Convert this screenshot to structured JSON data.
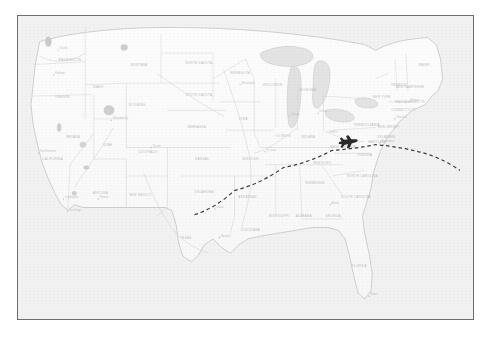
{
  "document": {
    "title": "United States Flight Path Map",
    "type": "map",
    "frame_style": "thin dark rectangular border"
  },
  "colors": {
    "page_background": "#ffffff",
    "frame_border": "#6e6e6e",
    "map_background": "#f2f2f2",
    "land_fill": "#fbfbfb",
    "water_fill": "#e2e2e2",
    "state_border": "#d5d5d5",
    "coastline": "#b8b8b8",
    "label_text": "#b9b9b9",
    "flight_path": "#3a3a3a",
    "plane_icon": "#2a2a2a"
  },
  "map": {
    "region": "Continental United States",
    "style": "faded scanned atlas",
    "projection_note": "curved northern border",
    "water_bodies": [
      "Pacific Ocean",
      "Atlantic Ocean",
      "Gulf of Mexico",
      "Lake Superior",
      "Lake Michigan",
      "Lake Huron",
      "Lake Erie",
      "Lake Ontario",
      "Great Salt Lake"
    ]
  },
  "flight": {
    "path_style": "dashed arc",
    "direction": "west to east",
    "plane_icon": "airplane-icon",
    "plane_heading": "east",
    "origin_label": "",
    "destination_label": "",
    "waypoints": [
      {
        "x": 163,
        "y": 139
      },
      {
        "x": 200,
        "y": 122
      },
      {
        "x": 245,
        "y": 106
      },
      {
        "x": 290,
        "y": 94
      },
      {
        "x": 330,
        "y": 90
      },
      {
        "x": 370,
        "y": 95
      },
      {
        "x": 408,
        "y": 108
      }
    ],
    "plane_position": {
      "x": 305,
      "y": 88
    }
  },
  "states": [
    {
      "name": "WASHINGTON",
      "x": 48,
      "y": 31
    },
    {
      "name": "OREGON",
      "x": 41,
      "y": 57
    },
    {
      "name": "IDAHO",
      "x": 74,
      "y": 50
    },
    {
      "name": "MONTANA",
      "x": 112,
      "y": 34
    },
    {
      "name": "NORTH DAKOTA",
      "x": 167,
      "y": 33
    },
    {
      "name": "SOUTH DAKOTA",
      "x": 167,
      "y": 55
    },
    {
      "name": "WYOMING",
      "x": 110,
      "y": 62
    },
    {
      "name": "NEVADA",
      "x": 51,
      "y": 85
    },
    {
      "name": "UTAH",
      "x": 83,
      "y": 90
    },
    {
      "name": "COLORADO",
      "x": 120,
      "y": 95
    },
    {
      "name": "NEBRASKA",
      "x": 165,
      "y": 78
    },
    {
      "name": "KANSAS",
      "x": 170,
      "y": 100
    },
    {
      "name": "OKLAHOMA",
      "x": 172,
      "y": 123
    },
    {
      "name": "TEXAS",
      "x": 155,
      "y": 155
    },
    {
      "name": "NEW MEXICO",
      "x": 113,
      "y": 125
    },
    {
      "name": "ARIZONA",
      "x": 76,
      "y": 124
    },
    {
      "name": "CALIFORNIA",
      "x": 32,
      "y": 100
    },
    {
      "name": "MINNESOTA",
      "x": 205,
      "y": 40
    },
    {
      "name": "IOWA",
      "x": 208,
      "y": 72
    },
    {
      "name": "MISSOURI",
      "x": 215,
      "y": 100
    },
    {
      "name": "ARKANSAS",
      "x": 212,
      "y": 127
    },
    {
      "name": "LOUISIANA",
      "x": 215,
      "y": 150
    },
    {
      "name": "WISCONSIN",
      "x": 235,
      "y": 48
    },
    {
      "name": "ILLINOIS",
      "x": 245,
      "y": 84
    },
    {
      "name": "MICHIGAN",
      "x": 268,
      "y": 52
    },
    {
      "name": "INDIANA",
      "x": 268,
      "y": 85
    },
    {
      "name": "OHIO",
      "x": 291,
      "y": 81
    },
    {
      "name": "KENTUCKY",
      "x": 281,
      "y": 103
    },
    {
      "name": "TENNESSEE",
      "x": 274,
      "y": 117
    },
    {
      "name": "MISSISSIPPI",
      "x": 241,
      "y": 140
    },
    {
      "name": "ALABAMA",
      "x": 264,
      "y": 140
    },
    {
      "name": "GEORGIA",
      "x": 291,
      "y": 140
    },
    {
      "name": "FLORIDA",
      "x": 315,
      "y": 175
    },
    {
      "name": "SOUTH CAROLINA",
      "x": 312,
      "y": 127
    },
    {
      "name": "NORTH CAROLINA",
      "x": 318,
      "y": 112
    },
    {
      "name": "VIRGINIA",
      "x": 320,
      "y": 97
    },
    {
      "name": "WEST VIRGINIA",
      "x": 300,
      "y": 92
    },
    {
      "name": "PENNSYLVANIA",
      "x": 322,
      "y": 76
    },
    {
      "name": "NEW YORK",
      "x": 336,
      "y": 57
    },
    {
      "name": "MAINE",
      "x": 375,
      "y": 34
    },
    {
      "name": "VERMONT",
      "x": 352,
      "y": 48
    },
    {
      "name": "NEW HAMPSHIRE",
      "x": 362,
      "y": 50
    },
    {
      "name": "MASSACHUSETTS",
      "x": 362,
      "y": 60
    },
    {
      "name": "CONNECTICUT",
      "x": 356,
      "y": 66
    },
    {
      "name": "NEW JERSEY",
      "x": 342,
      "y": 78
    },
    {
      "name": "DELAWARE",
      "x": 340,
      "y": 85
    },
    {
      "name": "MARYLAND",
      "x": 332,
      "y": 88
    }
  ],
  "cities": [
    {
      "name": "Seattle",
      "x": 37,
      "y": 24
    },
    {
      "name": "Portland",
      "x": 33,
      "y": 41
    },
    {
      "name": "San Francisco",
      "x": 19,
      "y": 96
    },
    {
      "name": "Los Angeles",
      "x": 42,
      "y": 128
    },
    {
      "name": "San Diego",
      "x": 46,
      "y": 137
    },
    {
      "name": "Phoenix",
      "x": 74,
      "y": 128
    },
    {
      "name": "Denver",
      "x": 123,
      "y": 92
    },
    {
      "name": "Salt Lake City",
      "x": 86,
      "y": 73
    },
    {
      "name": "Dallas",
      "x": 182,
      "y": 135
    },
    {
      "name": "Houston",
      "x": 186,
      "y": 155
    },
    {
      "name": "Chicago",
      "x": 250,
      "y": 70
    },
    {
      "name": "Minneapolis",
      "x": 205,
      "y": 48
    },
    {
      "name": "St. Louis",
      "x": 228,
      "y": 95
    },
    {
      "name": "Atlanta",
      "x": 288,
      "y": 132
    },
    {
      "name": "Miami",
      "x": 324,
      "y": 196
    },
    {
      "name": "New York",
      "x": 348,
      "y": 72
    },
    {
      "name": "Boston",
      "x": 361,
      "y": 60
    },
    {
      "name": "Washington",
      "x": 334,
      "y": 89
    },
    {
      "name": "Detroit",
      "x": 277,
      "y": 68
    }
  ]
}
